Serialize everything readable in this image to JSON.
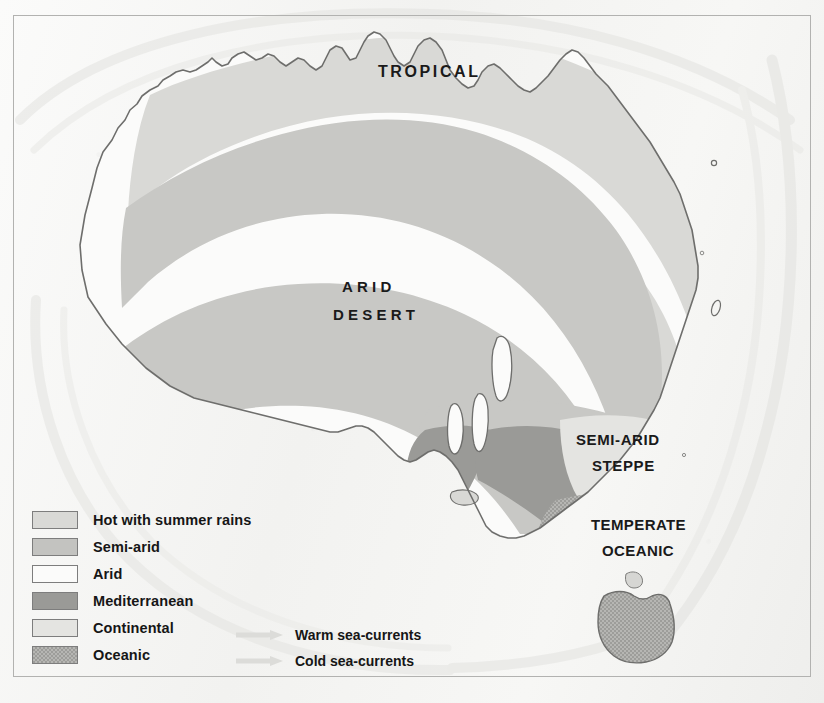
{
  "map": {
    "title": "Climate Map of Australia",
    "region_labels": [
      {
        "name": "tropical",
        "line1": "TROPICAL",
        "line2": ""
      },
      {
        "name": "arid-desert",
        "line1": "ARID",
        "line2": "DESERT"
      },
      {
        "name": "semi-arid-steppe",
        "line1": "SEMI-ARID",
        "line2": "STEPPE"
      },
      {
        "name": "temperate-oceanic",
        "line1": "TEMPERATE",
        "line2": "OCEANIC"
      }
    ]
  },
  "legend": {
    "items": [
      {
        "key": "hot-summer-rains",
        "label": "Hot with summer rains",
        "color": "#d9d9d6",
        "pattern": "solid"
      },
      {
        "key": "semi-arid",
        "label": "Semi-arid",
        "color": "#c3c3c0",
        "pattern": "solid"
      },
      {
        "key": "arid",
        "label": "Arid",
        "color": "#fbfbfa",
        "pattern": "solid"
      },
      {
        "key": "mediterranean",
        "label": "Mediterranean",
        "color": "#9a9a97",
        "pattern": "solid"
      },
      {
        "key": "continental",
        "label": "Continental",
        "color": "#e4e4e1",
        "pattern": "solid"
      },
      {
        "key": "oceanic",
        "label": "Oceanic",
        "color": "#adadaa",
        "pattern": "stipple"
      }
    ]
  },
  "currents": {
    "items": [
      {
        "key": "warm-sea-currents",
        "label": "Warm sea-currents",
        "color": "#dcdcd9"
      },
      {
        "key": "cold-sea-currents",
        "label": "Cold sea-currents",
        "color": "#dcdcd9"
      }
    ]
  },
  "colors": {
    "paper": "#f4f4f2",
    "frame": "#b2b2b0",
    "coastline": "#6e6e6c",
    "ocean": "#f4f4f2",
    "text": "#161616"
  }
}
